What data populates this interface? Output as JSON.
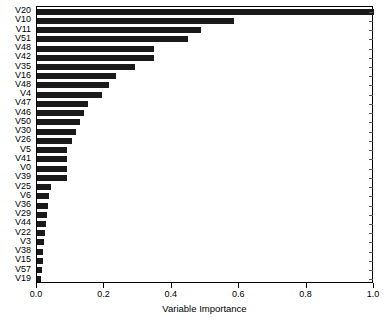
{
  "chart_data": {
    "type": "bar",
    "orientation": "horizontal",
    "title": "",
    "subtitle": "",
    "xlabel": "Variable Importance",
    "ylabel": "",
    "xlim": [
      0.0,
      1.0
    ],
    "xticks": [
      0.0,
      0.2,
      0.4,
      0.6,
      0.8,
      1.0
    ],
    "xticklabels": [
      "0.0",
      "0.2",
      "0.4",
      "0.6",
      "0.8",
      "1.0"
    ],
    "grid": false,
    "legend": null,
    "bar_color": "#1a1a1a",
    "categories": [
      "V20",
      "V10",
      "V11",
      "V51",
      "V48",
      "V42",
      "V35",
      "V16",
      "V48",
      "V4",
      "V47",
      "V46",
      "V50",
      "V30",
      "V26",
      "V5",
      "V41",
      "V0",
      "V39",
      "V25",
      "V6",
      "V36",
      "V29",
      "V44",
      "V22",
      "V3",
      "V38",
      "V15",
      "V57",
      "V19"
    ],
    "values": [
      1.0,
      0.585,
      0.487,
      0.448,
      0.347,
      0.347,
      0.291,
      0.234,
      0.214,
      0.193,
      0.151,
      0.139,
      0.127,
      0.116,
      0.104,
      0.089,
      0.089,
      0.089,
      0.089,
      0.042,
      0.036,
      0.033,
      0.03,
      0.027,
      0.024,
      0.021,
      0.018,
      0.018,
      0.015,
      0.012
    ]
  },
  "axis": {
    "x_title": "Variable Importance"
  }
}
